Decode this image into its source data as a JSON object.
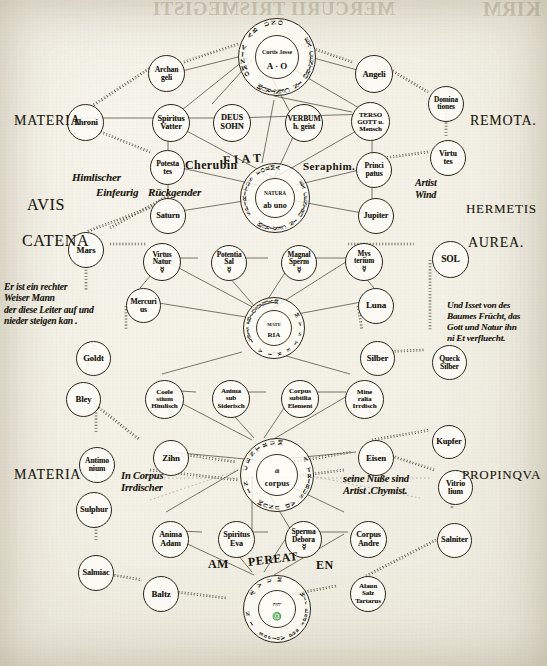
{
  "page": {
    "width": 547,
    "height": 666,
    "ink": "#17140d",
    "paper": "#f3f1e6"
  },
  "bleed_through": {
    "center": "MERCURII TRISMEGISTI",
    "right": "KIRM"
  },
  "side_labels": [
    {
      "name": "materia-remota-left",
      "text": "MATERIA",
      "x": 14,
      "y": 113,
      "size": 14
    },
    {
      "name": "remota-right",
      "text": "REMOTA.",
      "x": 470,
      "y": 113,
      "size": 14
    },
    {
      "name": "avis-left",
      "text": "AVIS",
      "x": 27,
      "y": 196,
      "size": 16
    },
    {
      "name": "hermetis-right",
      "text": "HERMETIS",
      "x": 466,
      "y": 201,
      "size": 13
    },
    {
      "name": "catena-left",
      "text": "CATENA",
      "x": 22,
      "y": 232,
      "size": 16
    },
    {
      "name": "aurea-right",
      "text": "AUREA.",
      "x": 468,
      "y": 235,
      "size": 14
    },
    {
      "name": "materia-propinqua-left",
      "text": "MATERIA",
      "x": 14,
      "y": 467,
      "size": 14
    },
    {
      "name": "propinqua-right",
      "text": "PROPINQVA",
      "x": 462,
      "y": 467,
      "size": 13
    }
  ],
  "latin_inline": [
    {
      "name": "fiat-label",
      "text": "F I A T",
      "x": 223,
      "y": 152,
      "size": 12,
      "rot": -4
    },
    {
      "name": "cherubin-label",
      "text": "Cherubin",
      "x": 185,
      "y": 158,
      "size": 12,
      "rot": 0
    },
    {
      "name": "seraphim-label",
      "text": "Seraphim.",
      "x": 303,
      "y": 160,
      "size": 11,
      "rot": 0
    },
    {
      "name": "am-label",
      "text": "AM",
      "x": 208,
      "y": 557,
      "size": 12,
      "rot": 0
    },
    {
      "name": "pereat-label",
      "text": "PEREAT",
      "x": 248,
      "y": 552,
      "size": 12,
      "rot": -7
    },
    {
      "name": "en-label",
      "text": "EN",
      "x": 316,
      "y": 558,
      "size": 12,
      "rot": 0
    }
  ],
  "german_notes": [
    {
      "name": "note-himlischer",
      "lines": [
        "Himlischer"
      ],
      "x": 72,
      "y": 171,
      "size": 11,
      "align": "left"
    },
    {
      "name": "note-einfeurig",
      "lines": [
        "Einfeurig"
      ],
      "x": 96,
      "y": 186,
      "size": 11,
      "align": "left"
    },
    {
      "name": "note-ruckgender",
      "lines": [
        "Rückgender"
      ],
      "x": 148,
      "y": 186,
      "size": 11,
      "align": "left"
    },
    {
      "name": "note-artist-wind",
      "lines": [
        "Artist",
        "Wind"
      ],
      "x": 415,
      "y": 177,
      "size": 10,
      "align": "left"
    },
    {
      "name": "note-leiter",
      "lines": [
        "Er ist ein rechter",
        "Weiser Mann",
        "der diese Leiter auf und",
        "nieder steigen kan ."
      ],
      "x": 4,
      "y": 281,
      "size": 9.6,
      "align": "left"
    },
    {
      "name": "note-baum",
      "lines": [
        "Und Isset von des",
        "Baumes Frücht, das",
        "Gott und Natur ihn",
        "ni Et verfluecht."
      ],
      "x": 447,
      "y": 300,
      "size": 9.2,
      "align": "left"
    },
    {
      "name": "note-in-corpus",
      "lines": [
        "In Corpus",
        "Irrdischer"
      ],
      "x": 121,
      "y": 470,
      "size": 10.5,
      "align": "left"
    },
    {
      "name": "note-artist-chym",
      "lines": [
        "seine Nuße sind",
        "Artist .Chymist."
      ],
      "x": 343,
      "y": 473,
      "size": 10.5,
      "align": "left"
    }
  ],
  "rings": [
    {
      "name": "ring-omnia-ab-uno",
      "x": 238,
      "y": 18,
      "size": 78,
      "outer_text": "OMNIA AB UNO EXALTATUM EX CENTRO IN CENTRUM",
      "arc_top": "OMNIA AB UNO",
      "arc_left": "EXALTATUM",
      "arc_bottom": "EX CENTRO IN CENTRUM",
      "center_small": "Curtis Jesse",
      "center_big": "A · O"
    },
    {
      "name": "ring-natura-ab-uno",
      "x": 240,
      "y": 163,
      "size": 70,
      "outer_text": "SPIRITUS FORMA EX CENTRO IN CENTRUM",
      "arc_top": "SPIRITUS FORMA",
      "arc_left": "EX",
      "arc_bottom": "EX CENTRO IN CENTRUM",
      "center_small": "NATURA",
      "center_big": "ab uno"
    },
    {
      "name": "ring-lapis-philosophorum",
      "x": 243,
      "y": 297,
      "size": 62,
      "outer_text": "LAPIS PHILOSOPHORUM MYSTERIA",
      "arc_top": "LAPIS PHILOSOPHORUM",
      "arc_left": "L",
      "arc_bottom": "MYSTERIA",
      "center_small": "MATE",
      "center_big": "RIA"
    },
    {
      "name": "ring-ex-centro-a-tribus",
      "x": 240,
      "y": 438,
      "size": 74,
      "outer_text": "EX CENTRO IN CENTRUM A TRIBUS AD UNUM",
      "arc_top": "IN CENTRUM",
      "arc_left": "EX",
      "arc_bottom": "A TRIBUS AD UNUM",
      "center_small": "di",
      "center_big": "corpus"
    },
    {
      "name": "ring-in-aevum",
      "x": 243,
      "y": 575,
      "size": 68,
      "outer_text": "IN ÆVUM BENEDICATUS",
      "arc_top": "IN ÆVUM",
      "arc_left": "B",
      "arc_bottom": "Wir Ende und Anfang",
      "center_small": "יהוה",
      "center_big": "♎"
    }
  ],
  "nodes": [
    {
      "name": "node-throni",
      "lines": [
        "Throni"
      ],
      "x": 67,
      "y": 104,
      "d": 37,
      "size": 8.5
    },
    {
      "name": "node-archangeli",
      "lines": [
        "Archan",
        "geli"
      ],
      "x": 148,
      "y": 55,
      "d": 37,
      "size": 7.6
    },
    {
      "name": "node-angeli",
      "lines": [
        "Angeli"
      ],
      "x": 355,
      "y": 55,
      "d": 38,
      "size": 8.5
    },
    {
      "name": "node-dominationes",
      "lines": [
        "Domina",
        "tiones"
      ],
      "x": 428,
      "y": 86,
      "d": 36,
      "size": 7.2
    },
    {
      "name": "node-spiritus-vatter",
      "lines": [
        "Spiritus",
        "Vatter"
      ],
      "x": 152,
      "y": 104,
      "d": 38,
      "size": 8.2
    },
    {
      "name": "node-deus-sohn",
      "lines": [
        "DEUS",
        "SOHN"
      ],
      "x": 213,
      "y": 104,
      "d": 38,
      "size": 8.4
    },
    {
      "name": "node-verbum-hgeist",
      "lines": [
        "VERBUM",
        "h. geist"
      ],
      "x": 285,
      "y": 104,
      "d": 38,
      "size": 7.6
    },
    {
      "name": "node-tertio",
      "lines": [
        "TERSO",
        "GOTT u.",
        "Mensch"
      ],
      "x": 351,
      "y": 102,
      "d": 39,
      "size": 6.9
    },
    {
      "name": "node-virtutes",
      "lines": [
        "Virtu",
        "tes"
      ],
      "x": 430,
      "y": 140,
      "d": 36,
      "size": 8
    },
    {
      "name": "node-potestates",
      "lines": [
        "Potesta",
        "tes"
      ],
      "x": 150,
      "y": 150,
      "d": 35,
      "size": 7.5
    },
    {
      "name": "node-principatus",
      "lines": [
        "Princi",
        "patus"
      ],
      "x": 356,
      "y": 152,
      "d": 36,
      "size": 7.6
    },
    {
      "name": "node-saturn",
      "lines": [
        "Saturn"
      ],
      "x": 150,
      "y": 198,
      "d": 36,
      "size": 8.2
    },
    {
      "name": "node-jupiter",
      "lines": [
        "Jupiter"
      ],
      "x": 358,
      "y": 198,
      "d": 36,
      "size": 8.2
    },
    {
      "name": "node-mars",
      "lines": [
        "Mars"
      ],
      "x": 68,
      "y": 232,
      "d": 36,
      "size": 8.5
    },
    {
      "name": "node-virtus-naturae",
      "lines": [
        "Virtus",
        "Natur",
        "☿"
      ],
      "x": 143,
      "y": 243,
      "d": 38,
      "size": 7.4
    },
    {
      "name": "node-potentia",
      "lines": [
        "Potentia",
        "Sal",
        "☿"
      ],
      "x": 211,
      "y": 245,
      "d": 36,
      "size": 7.2
    },
    {
      "name": "node-magnalia",
      "lines": [
        "Magnal",
        "Sperm",
        "☿"
      ],
      "x": 281,
      "y": 245,
      "d": 36,
      "size": 7.2
    },
    {
      "name": "node-mysterium",
      "lines": [
        "Mys",
        "terium",
        "☿"
      ],
      "x": 345,
      "y": 243,
      "d": 38,
      "size": 7.2,
      "bold": true
    },
    {
      "name": "node-sol",
      "lines": [
        "SOL"
      ],
      "x": 432,
      "y": 241,
      "d": 37,
      "size": 9.5
    },
    {
      "name": "node-mercurius",
      "lines": [
        "Mercuri",
        "us"
      ],
      "x": 126,
      "y": 288,
      "d": 35,
      "size": 7.6
    },
    {
      "name": "node-luna",
      "lines": [
        "Luna"
      ],
      "x": 358,
      "y": 288,
      "d": 36,
      "size": 9
    },
    {
      "name": "node-gold",
      "lines": [
        "Goldt"
      ],
      "x": 76,
      "y": 341,
      "d": 35,
      "size": 8.6
    },
    {
      "name": "node-silber",
      "lines": [
        "Silber"
      ],
      "x": 360,
      "y": 341,
      "d": 35,
      "size": 8.6
    },
    {
      "name": "node-quecksilber",
      "lines": [
        "Queck",
        "Silber"
      ],
      "x": 432,
      "y": 345,
      "d": 35,
      "size": 7.6
    },
    {
      "name": "node-bley",
      "lines": [
        "Bley"
      ],
      "x": 66,
      "y": 382,
      "d": 35,
      "size": 8.6
    },
    {
      "name": "node-coelestium",
      "lines": [
        "Coele",
        "stium",
        "Himlisch"
      ],
      "x": 145,
      "y": 380,
      "d": 39,
      "size": 7.1
    },
    {
      "name": "node-anima-sub",
      "lines": [
        "Anima",
        "sub",
        "Siderisch"
      ],
      "x": 212,
      "y": 380,
      "d": 38,
      "size": 7.1
    },
    {
      "name": "node-corpus-subtil",
      "lines": [
        "Corpus",
        "subtilia",
        "Element"
      ],
      "x": 281,
      "y": 380,
      "d": 38,
      "size": 7.1
    },
    {
      "name": "node-mineralia",
      "lines": [
        "Mine",
        "ralia",
        "Irrdisch"
      ],
      "x": 345,
      "y": 380,
      "d": 39,
      "size": 7.1
    },
    {
      "name": "node-kupfer",
      "lines": [
        "Kupfer"
      ],
      "x": 432,
      "y": 425,
      "d": 34,
      "size": 8.4
    },
    {
      "name": "node-antimonium",
      "lines": [
        "Antimo",
        "nium"
      ],
      "x": 79,
      "y": 447,
      "d": 36,
      "size": 7.6
    },
    {
      "name": "node-zinn",
      "lines": [
        "Zihn"
      ],
      "x": 153,
      "y": 440,
      "d": 36,
      "size": 8.8
    },
    {
      "name": "node-eisen",
      "lines": [
        "Eisen"
      ],
      "x": 358,
      "y": 440,
      "d": 36,
      "size": 8.8
    },
    {
      "name": "node-vitriolium",
      "lines": [
        "Vitrio",
        "lium"
      ],
      "x": 438,
      "y": 470,
      "d": 35,
      "size": 7.8
    },
    {
      "name": "node-sulphur",
      "lines": [
        "Sulphur"
      ],
      "x": 76,
      "y": 492,
      "d": 36,
      "size": 8.2
    },
    {
      "name": "node-salniter",
      "lines": [
        "Salniter"
      ],
      "x": 437,
      "y": 523,
      "d": 35,
      "size": 8.2
    },
    {
      "name": "node-anima-adam",
      "lines": [
        "Anima",
        "Adam"
      ],
      "x": 152,
      "y": 521,
      "d": 37,
      "size": 8
    },
    {
      "name": "node-spiritus-eva",
      "lines": [
        "Spiritus",
        "Eva"
      ],
      "x": 218,
      "y": 521,
      "d": 37,
      "size": 8
    },
    {
      "name": "node-sperma-debora",
      "lines": [
        "Sperma",
        "Debora",
        "☿"
      ],
      "x": 285,
      "y": 521,
      "d": 37,
      "size": 7.4
    },
    {
      "name": "node-corpus-andre",
      "lines": [
        "Corpus",
        "Andre"
      ],
      "x": 350,
      "y": 521,
      "d": 37,
      "size": 8
    },
    {
      "name": "node-salmiac",
      "lines": [
        "Salmiac"
      ],
      "x": 78,
      "y": 555,
      "d": 36,
      "size": 8.2
    },
    {
      "name": "node-baltz",
      "lines": [
        "Baltz"
      ],
      "x": 143,
      "y": 576,
      "d": 36,
      "size": 8.8
    },
    {
      "name": "node-alaun-tartar",
      "lines": [
        "Alaun",
        "Salz",
        "Tartarus"
      ],
      "x": 350,
      "y": 576,
      "d": 36,
      "size": 7.1
    }
  ],
  "edges_solid": [
    [
      238,
      57,
      170,
      74
    ],
    [
      310,
      57,
      372,
      74
    ],
    [
      248,
      57,
      172,
      118
    ],
    [
      252,
      60,
      212,
      104
    ],
    [
      262,
      60,
      290,
      112
    ],
    [
      272,
      57,
      366,
      112
    ],
    [
      274,
      96,
      352,
      112
    ],
    [
      274,
      100,
      262,
      163
    ],
    [
      86,
      118,
      168,
      118
    ],
    [
      168,
      118,
      232,
      118
    ],
    [
      232,
      118,
      300,
      116
    ],
    [
      300,
      116,
      370,
      114
    ],
    [
      168,
      122,
      168,
      165
    ],
    [
      170,
      122,
      274,
      178
    ],
    [
      300,
      122,
      274,
      178
    ],
    [
      372,
      122,
      274,
      178
    ],
    [
      372,
      120,
      372,
      167
    ],
    [
      168,
      165,
      258,
      185
    ],
    [
      296,
      185,
      372,
      167
    ],
    [
      168,
      180,
      168,
      200
    ],
    [
      372,
      180,
      372,
      200
    ],
    [
      162,
      214,
      250,
      200
    ],
    [
      290,
      200,
      368,
      214
    ],
    [
      160,
      258,
      198,
      258
    ],
    [
      228,
      258,
      268,
      258
    ],
    [
      298,
      258,
      346,
      258
    ],
    [
      160,
      258,
      258,
      310
    ],
    [
      216,
      262,
      256,
      308
    ],
    [
      292,
      262,
      262,
      308
    ],
    [
      352,
      258,
      270,
      310
    ],
    [
      140,
      300,
      252,
      318
    ],
    [
      276,
      318,
      372,
      300
    ],
    [
      162,
      262,
      140,
      288
    ],
    [
      352,
      262,
      374,
      288
    ],
    [
      164,
      390,
      196,
      392
    ],
    [
      230,
      392,
      266,
      392
    ],
    [
      298,
      392,
      346,
      392
    ],
    [
      160,
      392,
      252,
      440
    ],
    [
      216,
      396,
      254,
      438
    ],
    [
      292,
      396,
      264,
      438
    ],
    [
      354,
      392,
      272,
      440
    ],
    [
      162,
      374,
      242,
      352
    ],
    [
      272,
      352,
      350,
      374
    ],
    [
      170,
      452,
      256,
      460
    ],
    [
      272,
      460,
      356,
      452
    ],
    [
      160,
      530,
      202,
      532
    ],
    [
      236,
      532,
      268,
      532
    ],
    [
      302,
      532,
      348,
      532
    ],
    [
      166,
      534,
      254,
      575
    ],
    [
      224,
      538,
      252,
      572
    ],
    [
      286,
      538,
      264,
      572
    ],
    [
      344,
      534,
      274,
      575
    ],
    [
      166,
      512,
      238,
      470
    ],
    [
      256,
      470,
      344,
      512
    ],
    [
      252,
      476,
      252,
      545
    ],
    [
      258,
      476,
      300,
      545
    ]
  ],
  "edges_dotted": [
    [
      86,
      110,
      150,
      68
    ],
    [
      86,
      126,
      150,
      152
    ],
    [
      184,
      62,
      238,
      44
    ],
    [
      352,
      62,
      300,
      44
    ],
    [
      374,
      60,
      428,
      92
    ],
    [
      446,
      104,
      446,
      138
    ],
    [
      428,
      152,
      368,
      160
    ],
    [
      168,
      196,
      110,
      228
    ],
    [
      170,
      200,
      86,
      232
    ],
    [
      110,
      244,
      146,
      244
    ],
    [
      348,
      244,
      414,
      244
    ],
    [
      86,
      248,
      86,
      290
    ],
    [
      126,
      306,
      126,
      330
    ],
    [
      94,
      345,
      86,
      370
    ],
    [
      358,
      306,
      362,
      330
    ],
    [
      376,
      352,
      424,
      350
    ],
    [
      430,
      260,
      430,
      330
    ],
    [
      84,
      396,
      140,
      440
    ],
    [
      96,
      400,
      96,
      432
    ],
    [
      96,
      464,
      96,
      478
    ],
    [
      96,
      508,
      96,
      540
    ],
    [
      96,
      572,
      142,
      580
    ],
    [
      160,
      590,
      226,
      598
    ],
    [
      372,
      440,
      430,
      430
    ],
    [
      380,
      452,
      434,
      470
    ],
    [
      452,
      488,
      452,
      508
    ],
    [
      436,
      540,
      366,
      576
    ],
    [
      336,
      586,
      272,
      598
    ],
    [
      166,
      452,
      236,
      462
    ],
    [
      270,
      466,
      352,
      452
    ],
    [
      438,
      350,
      438,
      360
    ],
    [
      150,
      470,
      238,
      480
    ],
    [
      266,
      480,
      344,
      470
    ]
  ],
  "edges_thin_long": [
    [
      148,
      478,
      430,
      478
    ],
    [
      150,
      500,
      250,
      466
    ],
    [
      262,
      466,
      420,
      498
    ]
  ]
}
